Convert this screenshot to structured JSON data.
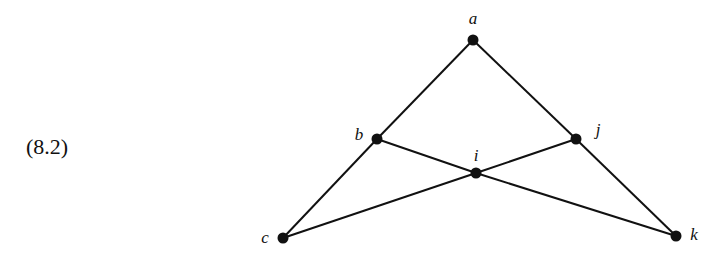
{
  "equation_label": "(8.2)",
  "graph": {
    "nodes": [
      {
        "id": "a",
        "label": "a",
        "x": 473,
        "y": 40,
        "lx": 473,
        "ly": 24,
        "anchor": "middle"
      },
      {
        "id": "b",
        "label": "b",
        "x": 377,
        "y": 139,
        "lx": 359,
        "ly": 140,
        "anchor": "middle"
      },
      {
        "id": "i",
        "label": "i",
        "x": 476,
        "y": 173,
        "lx": 476,
        "ly": 161,
        "anchor": "middle"
      },
      {
        "id": "j",
        "label": "j",
        "x": 576,
        "y": 139,
        "lx": 598,
        "ly": 135,
        "anchor": "middle"
      },
      {
        "id": "c",
        "label": "c",
        "x": 283,
        "y": 238,
        "lx": 265,
        "ly": 243,
        "anchor": "middle"
      },
      {
        "id": "k",
        "label": "k",
        "x": 676,
        "y": 236,
        "lx": 694,
        "ly": 240,
        "anchor": "middle"
      }
    ],
    "edges": [
      [
        "a",
        "b"
      ],
      [
        "a",
        "j"
      ],
      [
        "b",
        "c"
      ],
      [
        "b",
        "i"
      ],
      [
        "i",
        "j"
      ],
      [
        "i",
        "c"
      ],
      [
        "i",
        "k"
      ],
      [
        "j",
        "k"
      ]
    ],
    "node_radius": 5.5,
    "color": "#111111"
  }
}
